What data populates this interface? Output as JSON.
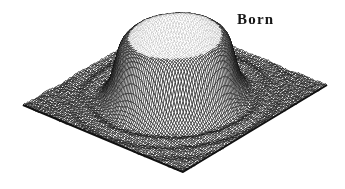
{
  "chart_data": {
    "type": "surface",
    "subtype": "3d-wireframe-hidden-line-mesh",
    "title": "",
    "annotations": [
      {
        "text": "Born",
        "position": "top-right"
      }
    ],
    "surface": {
      "description": "Born-approximation reconstruction of a homogeneous circular cylinder: flat-topped plateau of normalized height 1.0 centered on a square base plane, steep rounded walls, and small decaying concentric ripples in the surrounding plane",
      "shape": "top-hat-cylinder",
      "center": [
        0.5,
        0.5
      ],
      "radius": 0.285,
      "wall_width": 0.018,
      "plateau_height": 1.0,
      "ripple": {
        "amplitude": 0.04,
        "wavelength": 0.095,
        "decay": 0.22,
        "phase": -0.9
      },
      "rim_wobble": 0.012,
      "noise": 0.012,
      "grid": [
        100,
        100
      ],
      "zlim": [
        0,
        1
      ]
    },
    "view": {
      "corners": {
        "left": [
          23,
          105
        ],
        "front": [
          183,
          172
        ],
        "right": [
          327,
          85
        ],
        "back": [
          169,
          22
        ]
      },
      "height_px": 61
    },
    "style": {
      "background": "#ffffff",
      "stroke": "#111111",
      "fill": "#ffffff",
      "line_width": 0.6,
      "edge_width": 2.0,
      "flat_top_threshold": 0.965
    }
  }
}
